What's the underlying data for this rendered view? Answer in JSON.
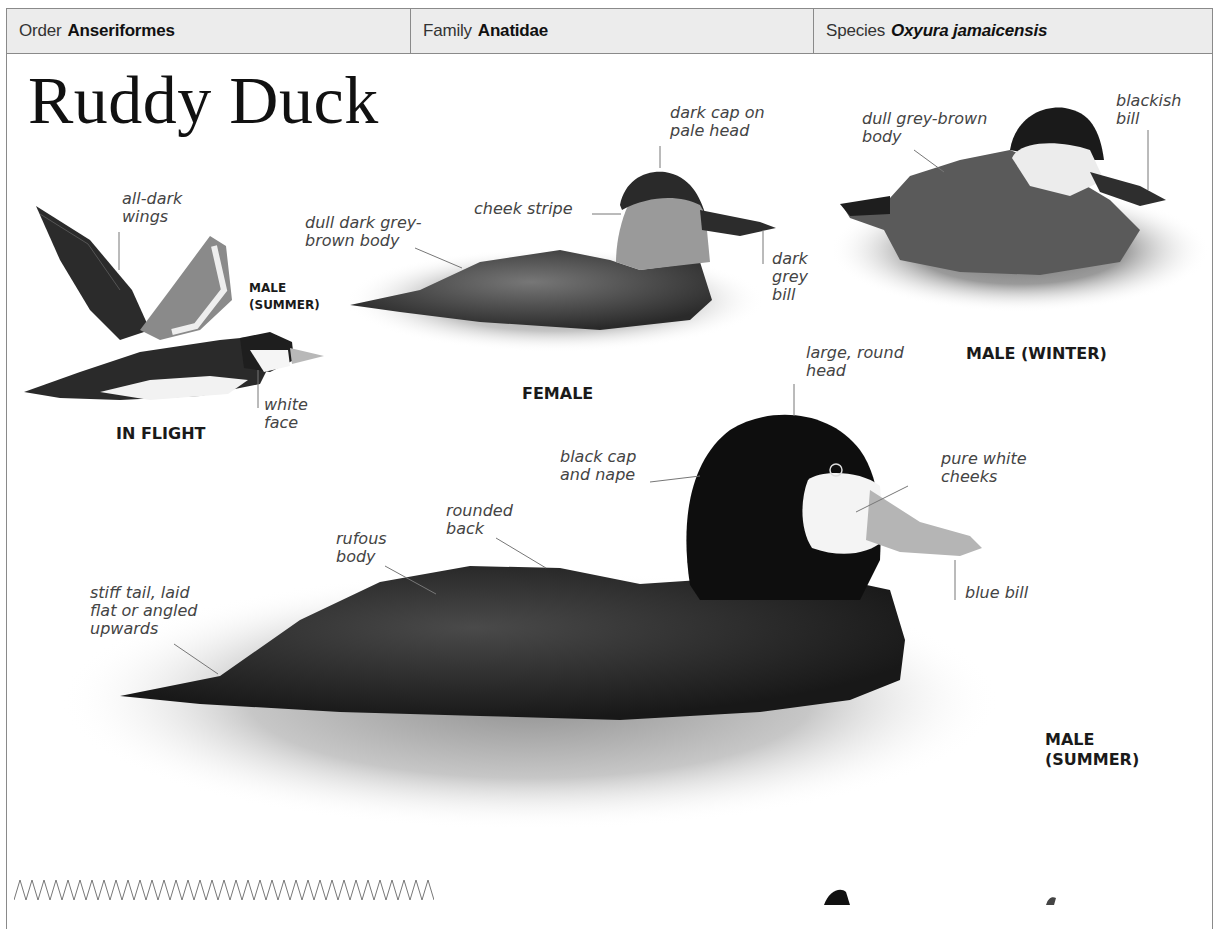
{
  "taxonomy": {
    "order": {
      "label": "Order",
      "value": "Anseriformes"
    },
    "family": {
      "label": "Family",
      "value": "Anatidae"
    },
    "species": {
      "label": "Species",
      "value": "Oxyura jamaicensis"
    }
  },
  "title": "Ruddy Duck",
  "figures": {
    "in_flight": {
      "caption": "IN FLIGHT",
      "sub_caption": "MALE\n(SUMMER)",
      "labels": {
        "wings": "all-dark\nwings",
        "face": "white\nface"
      }
    },
    "female": {
      "caption": "FEMALE",
      "labels": {
        "cap": "dark cap on\npale head",
        "cheek": "cheek stripe",
        "body": "dull dark grey-\nbrown body",
        "bill": "dark\ngrey\nbill"
      }
    },
    "male_winter": {
      "caption": "MALE (WINTER)",
      "labels": {
        "body": "dull grey-brown\nbody",
        "bill": "blackish\nbill"
      }
    },
    "male_summer": {
      "caption": "MALE\n(SUMMER)",
      "labels": {
        "head": "large, round\nhead",
        "cap": "black cap\nand nape",
        "cheeks": "pure white\ncheeks",
        "back": "rounded\nback",
        "body": "rufous\nbody",
        "tail": "stiff tail, laid\nflat or angled\nupwards",
        "bill": "blue bill"
      }
    }
  },
  "colors": {
    "header_bg": "#ececec",
    "border": "#8a8a8a",
    "label_text": "#444444",
    "caption_text": "#1a1a1a"
  }
}
